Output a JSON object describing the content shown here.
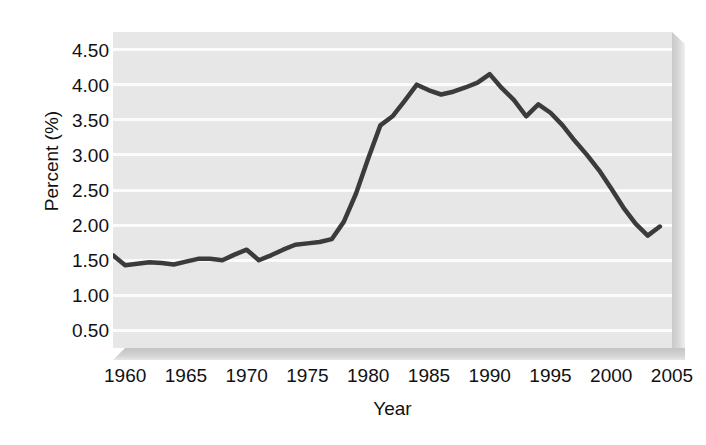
{
  "chart_data": {
    "type": "line",
    "title": "",
    "xlabel": "Year",
    "ylabel": "Percent (%)",
    "xlim": [
      1959,
      2005
    ],
    "ylim": [
      0.25,
      4.75
    ],
    "grid": true,
    "legend": null,
    "line_color": "#3b3b3b",
    "plot_background": "#e7e7e7",
    "gridline_color": "#fbfbfb",
    "y_ticks": [
      "0.50",
      "1.00",
      "1.50",
      "2.00",
      "2.50",
      "3.00",
      "3.50",
      "4.00",
      "4.50"
    ],
    "y_tick_values": [
      0.5,
      1.0,
      1.5,
      2.0,
      2.5,
      3.0,
      3.5,
      4.0,
      4.5
    ],
    "x_ticks": [
      "1960",
      "1965",
      "1970",
      "1975",
      "1980",
      "1985",
      "1990",
      "1995",
      "2000",
      "2005"
    ],
    "x_tick_values": [
      1960,
      1965,
      1970,
      1975,
      1980,
      1985,
      1990,
      1995,
      2000,
      2005
    ],
    "x": [
      1959,
      1960,
      1961,
      1962,
      1963,
      1964,
      1965,
      1966,
      1967,
      1968,
      1969,
      1970,
      1971,
      1972,
      1973,
      1974,
      1975,
      1976,
      1977,
      1978,
      1979,
      1980,
      1981,
      1982,
      1983,
      1984,
      1985,
      1986,
      1987,
      1988,
      1989,
      1990,
      1991,
      1992,
      1993,
      1994,
      1995,
      1996,
      1997,
      1998,
      1999,
      2000,
      2001,
      2002,
      2003,
      2004
    ],
    "values": [
      1.57,
      1.43,
      1.45,
      1.47,
      1.46,
      1.44,
      1.48,
      1.52,
      1.52,
      1.5,
      1.58,
      1.65,
      1.5,
      1.57,
      1.65,
      1.72,
      1.74,
      1.76,
      1.8,
      2.05,
      2.45,
      2.95,
      3.42,
      3.55,
      3.77,
      4.0,
      3.92,
      3.86,
      3.9,
      3.96,
      4.03,
      4.15,
      3.95,
      3.78,
      3.55,
      3.72,
      3.6,
      3.42,
      3.2,
      3.0,
      2.78,
      2.52,
      2.25,
      2.02,
      1.85,
      1.98
    ],
    "series_name": "Percent"
  }
}
